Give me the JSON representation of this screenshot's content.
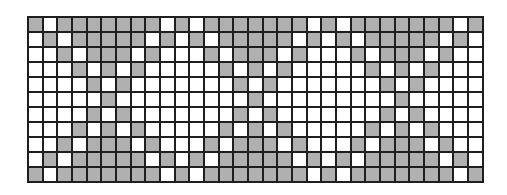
{
  "pattern_grid": {
    "rows": 11,
    "columns": 31,
    "colors": {
      "filled": "#b0b0b0",
      "empty": "#ffffff",
      "gridline": "#1e1e1e"
    },
    "legend": "1 = filled (gray), 0 = empty (white)",
    "cells": [
      "1011111110101111111010111111101",
      "0101111101010111110101011111010",
      "0010111010001011101000101110100",
      "0001010100000101010000010101000",
      "0000101000000010100000001010000",
      "0000010000000001000000000100000",
      "0000101000000010100000001010000",
      "0001010100000101010000010101000",
      "0010111010001011101000101110100",
      "0101111101010111110101011111010",
      "1011111110101111111010111111101"
    ]
  }
}
